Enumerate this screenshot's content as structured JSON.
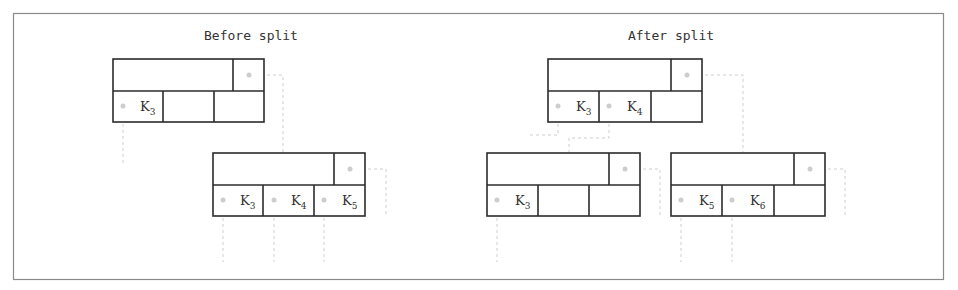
{
  "diagram": {
    "type": "btree-node-split",
    "colors": {
      "box_stroke": "#2b2b2b",
      "pointer_line": "#cfcfcf",
      "frame": "#8a8a8a"
    },
    "panels": [
      {
        "title": "Before split",
        "nodes": [
          {
            "id": "parent",
            "x": 113,
            "y": 59,
            "w": 151,
            "h": 63,
            "keys": [
              {
                "letter": "K",
                "sub": "3"
              },
              {
                "letter": "",
                "sub": ""
              },
              {
                "letter": "",
                "sub": ""
              }
            ]
          },
          {
            "id": "leaf",
            "x": 213,
            "y": 153,
            "w": 152,
            "h": 63,
            "keys": [
              {
                "letter": "K",
                "sub": "3"
              },
              {
                "letter": "K",
                "sub": "4"
              },
              {
                "letter": "K",
                "sub": "5"
              }
            ]
          }
        ]
      },
      {
        "title": "After split",
        "nodes": [
          {
            "id": "parent",
            "x": 548,
            "y": 59,
            "w": 154,
            "h": 63,
            "keys": [
              {
                "letter": "K",
                "sub": "3"
              },
              {
                "letter": "K",
                "sub": "4"
              },
              {
                "letter": "",
                "sub": ""
              }
            ]
          },
          {
            "id": "left-leaf",
            "x": 487,
            "y": 153,
            "w": 153,
            "h": 63,
            "keys": [
              {
                "letter": "K",
                "sub": "3"
              },
              {
                "letter": "",
                "sub": ""
              },
              {
                "letter": "",
                "sub": ""
              }
            ]
          },
          {
            "id": "right-leaf",
            "x": 671,
            "y": 153,
            "w": 154,
            "h": 63,
            "keys": [
              {
                "letter": "K",
                "sub": "5"
              },
              {
                "letter": "K",
                "sub": "6"
              },
              {
                "letter": "",
                "sub": ""
              }
            ]
          }
        ]
      }
    ]
  }
}
